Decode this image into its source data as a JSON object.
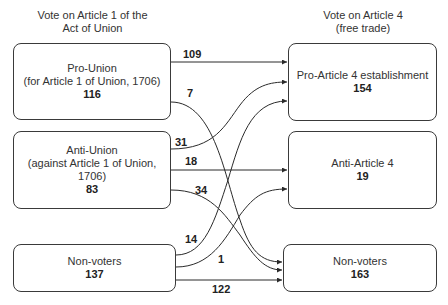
{
  "columns": {
    "left_title_line1": "Vote on Article 1 of the",
    "left_title_line2": "Act of Union",
    "right_title_line1": "Vote on Article 4",
    "right_title_line2": "(free trade)"
  },
  "left_nodes": [
    {
      "line1": "Pro-Union",
      "line2": "(for Article 1 of Union, 1706)",
      "line3": "",
      "count": "116"
    },
    {
      "line1": "Anti-Union",
      "line2": "(against Article 1 of Union,",
      "line3": "1706)",
      "count": "83"
    },
    {
      "line1": "Non-voters",
      "line2": "",
      "line3": "",
      "count": "137"
    }
  ],
  "right_nodes": [
    {
      "line1": "Pro-Article 4 establishment",
      "count": "154"
    },
    {
      "line1": "Anti-Article 4",
      "count": "19"
    },
    {
      "line1": "Non-voters",
      "count": "163"
    }
  ],
  "flows": [
    {
      "from": "Pro-Union",
      "to": "Pro-Article 4 establishment",
      "value": "109"
    },
    {
      "from": "Pro-Union",
      "to": "Non-voters",
      "value": "7"
    },
    {
      "from": "Anti-Union",
      "to": "Pro-Article 4 establishment",
      "value": "31"
    },
    {
      "from": "Anti-Union",
      "to": "Anti-Article 4",
      "value": "18"
    },
    {
      "from": "Anti-Union",
      "to": "Non-voters",
      "value": "34"
    },
    {
      "from": "Non-voters",
      "to": "Pro-Article 4 establishment",
      "value": "14"
    },
    {
      "from": "Non-voters",
      "to": "Anti-Article 4",
      "value": "1"
    },
    {
      "from": "Non-voters",
      "to": "Non-voters",
      "value": "122"
    }
  ]
}
